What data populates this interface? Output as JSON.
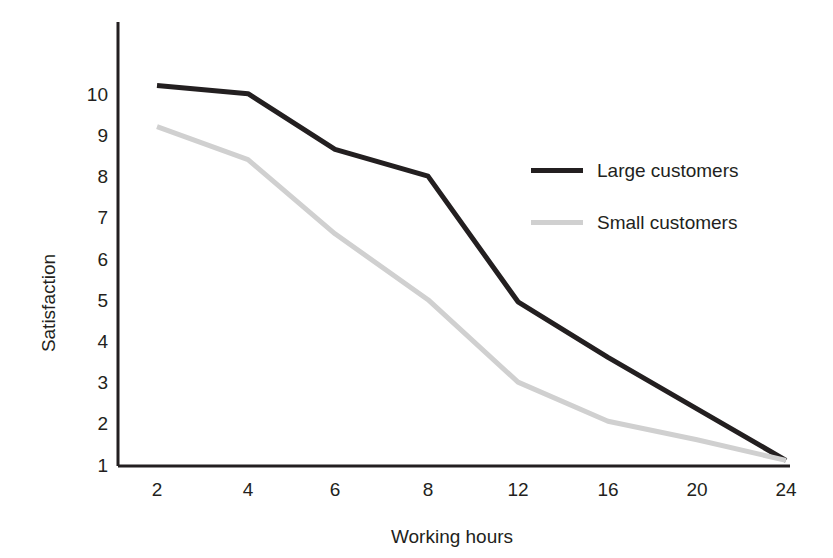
{
  "chart_data": {
    "type": "line",
    "title": "",
    "xlabel": "Working hours",
    "ylabel": "Satisfaction",
    "categories": [
      "2",
      "4",
      "6",
      "8",
      "12",
      "16",
      "20",
      "24"
    ],
    "yticks": [
      "10",
      "9",
      "8",
      "7",
      "6",
      "5",
      "4",
      "3",
      "2",
      "1"
    ],
    "ylim": [
      1,
      10.8
    ],
    "grid": false,
    "legend_position": "right-inside",
    "series": [
      {
        "name": "Large customers",
        "color": "#231f20",
        "linewidth": 5,
        "values": [
          10.2,
          10.0,
          8.65,
          8.0,
          4.95,
          3.6,
          2.35,
          1.1
        ]
      },
      {
        "name": "Small customers",
        "color": "#d0d0d0",
        "linewidth": 5,
        "values": [
          9.2,
          8.4,
          6.6,
          5.0,
          3.0,
          2.05,
          1.6,
          1.1
        ]
      }
    ]
  },
  "axes": {
    "y_axis_name": "y-axis-line",
    "x_axis_name": "x-axis-line"
  },
  "legend": {
    "entries": [
      {
        "label": "Large customers",
        "color": "#231f20",
        "width": 5
      },
      {
        "label": "Small customers",
        "color": "#d0d0d0",
        "width": 5
      }
    ]
  }
}
